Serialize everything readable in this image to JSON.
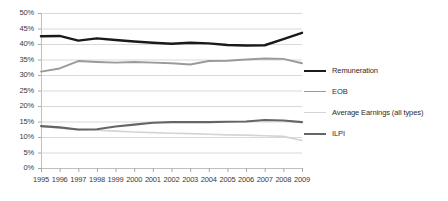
{
  "chart_data": {
    "type": "line",
    "title": "",
    "xlabel": "",
    "ylabel": "",
    "grid": true,
    "legend_position": "right",
    "ylim": [
      0,
      50
    ],
    "ytick_labels": [
      "50%",
      "45%",
      "40%",
      "35%",
      "30%",
      "25%",
      "20%",
      "15%",
      "10%",
      "5%",
      "0%"
    ],
    "ytick_values": [
      50,
      45,
      40,
      35,
      30,
      25,
      20,
      15,
      10,
      5,
      0
    ],
    "categories": [
      "1995",
      "1996",
      "1997",
      "1998",
      "1999",
      "2000",
      "2001",
      "2002",
      "2003",
      "2004",
      "2005",
      "2006",
      "2007",
      "2008",
      "2009"
    ],
    "series": [
      {
        "name": "Remuneration",
        "color": "#1a1a1a",
        "width": 2.4,
        "values": [
          42.5,
          42.6,
          41.1,
          41.8,
          41.3,
          40.8,
          40.4,
          40.1,
          40.4,
          40.2,
          39.7,
          39.5,
          39.6,
          41.6,
          43.6
        ]
      },
      {
        "name": "EOB",
        "color": "#9a9a9a",
        "width": 1.9,
        "values": [
          31.1,
          32.1,
          34.5,
          34.2,
          34.0,
          34.2,
          34.0,
          33.8,
          33.4,
          34.5,
          34.6,
          35.0,
          35.3,
          35.2,
          33.8
        ]
      },
      {
        "name": "Average Earnings (all types)",
        "color": "#d4d4d4",
        "width": 1.6,
        "values": [
          13.4,
          12.9,
          12.3,
          12.2,
          11.9,
          11.6,
          11.4,
          11.2,
          11.1,
          10.9,
          10.7,
          10.6,
          10.4,
          10.2,
          8.9
        ]
      },
      {
        "name": "ILPI",
        "color": "#656565",
        "width": 2.1,
        "values": [
          13.5,
          13.1,
          12.4,
          12.5,
          13.4,
          14.0,
          14.6,
          14.8,
          14.8,
          14.8,
          14.9,
          15.0,
          15.5,
          15.3,
          14.8
        ]
      }
    ]
  },
  "legend": {
    "items": [
      {
        "label": "Remuneration",
        "color": "#1a1a1a",
        "width": 2.4
      },
      {
        "label": "EOB",
        "color": "#9a9a9a",
        "width": 1.9
      },
      {
        "label": "Average Earnings (all types)",
        "color": "#d4d4d4",
        "width": 1.6
      },
      {
        "label": "ILPI",
        "color": "#656565",
        "width": 2.1
      }
    ]
  },
  "axes": {
    "grid_color": "#d9d9d9",
    "axis_color": "#bfbfbf",
    "tick_color": "#a8a8a8",
    "plot_left": 41,
    "plot_right": 302,
    "plot_top": 13,
    "plot_bottom": 168
  }
}
